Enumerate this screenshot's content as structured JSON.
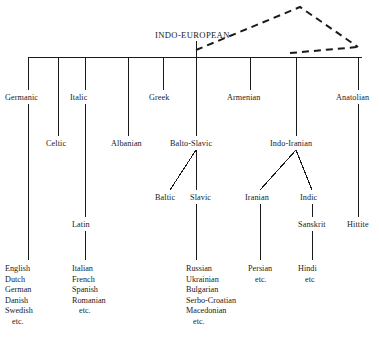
{
  "diagram": {
    "title": "INDO-EUROPEAN",
    "type": "family-tree",
    "root": {
      "label": "INDO-EUROPEAN",
      "x": 196,
      "y": 36
    },
    "dashed_overlay": {
      "description": "dashed triangle from root node to apex and down to right end of main bar",
      "points": "196,50 300,7 358,47"
    },
    "branches_tier1": [
      {
        "label": "Germanic",
        "x": 5,
        "y": 100
      },
      {
        "label": "Italic",
        "x": 70,
        "y": 100
      },
      {
        "label": "Greek",
        "x": 150,
        "y": 100
      },
      {
        "label": "Armenian",
        "x": 228,
        "y": 100
      },
      {
        "label": "Anatolian",
        "x": 337,
        "y": 100
      }
    ],
    "branches_tier2": [
      {
        "label": "Celtic",
        "x": 47,
        "y": 146
      },
      {
        "label": "Albanian",
        "x": 112,
        "y": 146
      },
      {
        "label": "Balto-Slavic",
        "x": 171,
        "y": 146
      },
      {
        "label": "Indo-Iranian",
        "x": 271,
        "y": 146
      }
    ],
    "branches_tier3": [
      {
        "label": "Baltic",
        "x": 156,
        "y": 200
      },
      {
        "label": "Slavic",
        "x": 191,
        "y": 200
      },
      {
        "label": "Iranian",
        "x": 246,
        "y": 200
      },
      {
        "label": "Indic",
        "x": 301,
        "y": 200
      }
    ],
    "branches_tier4": [
      {
        "label": "Latin",
        "x": 72,
        "y": 227
      },
      {
        "label": "Sanskrit",
        "x": 299,
        "y": 227
      },
      {
        "label": "Hittite",
        "x": 348,
        "y": 227
      }
    ],
    "leaf_lists": [
      {
        "name": "germanic-languages",
        "x": 5,
        "y": 267,
        "items": [
          "English",
          "Dutch",
          "German",
          "Danish",
          "Swedish"
        ],
        "etc": "etc."
      },
      {
        "name": "italic-languages",
        "x": 72,
        "y": 267,
        "items": [
          "Italian",
          "French",
          "Spanish",
          "Romanian"
        ],
        "etc": "etc."
      },
      {
        "name": "slavic-languages",
        "x": 186,
        "y": 267,
        "items": [
          "Russian",
          "Ukrainian",
          "Bulgarian",
          "Serbo-Croatian",
          "Macedonian"
        ],
        "etc": "etc."
      },
      {
        "name": "iranian-languages",
        "x": 248,
        "y": 267,
        "items": [
          "Persian"
        ],
        "etc": "etc."
      },
      {
        "name": "indic-languages",
        "x": 298,
        "y": 267,
        "items": [
          "Hindi"
        ],
        "etc": "etc"
      }
    ],
    "colors": {
      "line": "#1a1a1a",
      "text": "#1a1a1a",
      "background": "#ffffff"
    }
  }
}
